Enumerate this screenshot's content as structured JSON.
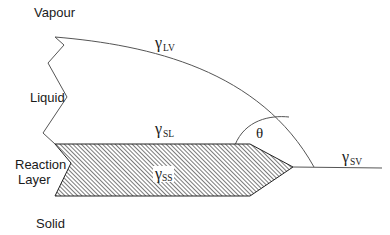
{
  "diagram": {
    "type": "wetting-reaction-layer-schematic",
    "regions": {
      "vapour": "Vapour",
      "liquid": "Liquid",
      "reaction_layer_line1": "Reaction",
      "reaction_layer_line2": "Layer",
      "solid": "Solid"
    },
    "tensions": {
      "lv": {
        "symbol": "γ",
        "subscript": "LV"
      },
      "sl": {
        "symbol": "γ",
        "subscript": "SL"
      },
      "ss": {
        "symbol": "γ",
        "subscript": "SS"
      },
      "sv": {
        "symbol": "γ",
        "subscript": "SV"
      }
    },
    "angle_label": "θ",
    "colors": {
      "line": "#555555",
      "hatch": "#333333",
      "background": "#ffffff"
    }
  }
}
